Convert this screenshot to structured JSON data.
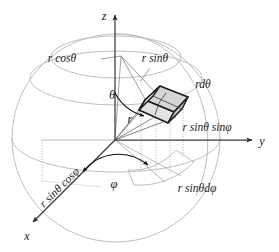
{
  "figure": {
    "axes": {
      "z": "z",
      "y": "y",
      "x": "x"
    },
    "labels": {
      "r_cos_theta": "r cosθ",
      "r_sin_theta": "r sinθ",
      "r_d_theta": "rdθ",
      "r_sin_theta_sin_phi": "r sinθ sinφ",
      "r_sin_theta_cos_phi": "r sinθ cosφ",
      "r_sin_theta_d_phi": "r sinθdφ",
      "theta": "θ",
      "phi": "φ",
      "r": "r"
    },
    "colors": {
      "sphere_outline": "#b8b8b8",
      "grid": "#9a9a9a",
      "axis": "#3a3a3a",
      "wedge_fill_light": "#d9d9d9",
      "wedge_fill_mid": "#c9c9c9",
      "wedge_fill_dark": "#bdbdbd",
      "wedge_outline": "#1a1a1a",
      "text": "#1a1a1a",
      "background": "#ffffff"
    },
    "geometry": {
      "origin_x": 115,
      "origin_y": 140,
      "sphere_center_x": 116,
      "sphere_center_y": 138,
      "sphere_radius": 104
    }
  }
}
